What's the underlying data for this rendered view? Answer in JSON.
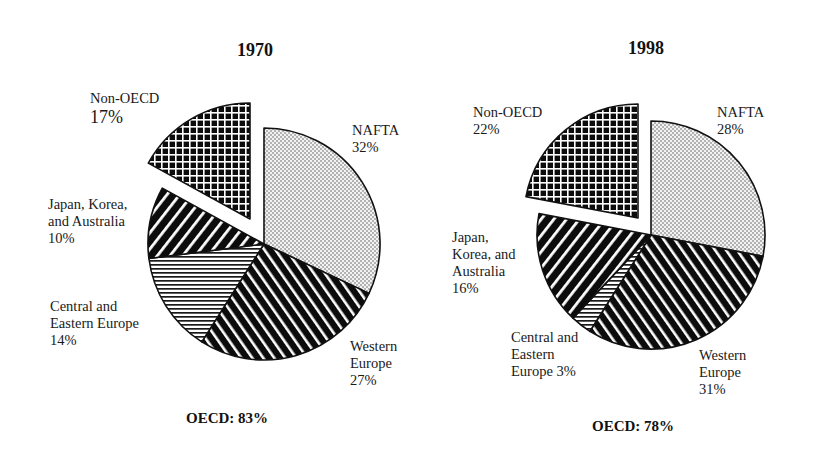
{
  "chart_data": [
    {
      "type": "pie",
      "title": "1970",
      "total_label": "OECD: 83%",
      "center": [
        264,
        244
      ],
      "radius": 116,
      "explode": {
        "slice": "Non-OECD",
        "dx": -14,
        "dy": -25
      },
      "slices": [
        {
          "label": "NAFTA",
          "value": 32,
          "pattern": "dots"
        },
        {
          "label": "Western Europe",
          "value": 27,
          "pattern": "diag-down"
        },
        {
          "label": "Central and Eastern Europe",
          "value": 14,
          "pattern": "horiz"
        },
        {
          "label": "Japan, Korea, and Australia",
          "value": 10,
          "pattern": "diag-up"
        },
        {
          "label": "Non-OECD",
          "value": 17,
          "pattern": "grid"
        }
      ]
    },
    {
      "type": "pie",
      "title": "1998",
      "total_label": "OECD: 78%",
      "center": [
        651,
        235
      ],
      "radius": 114,
      "explode": {
        "slice": "Non-OECD",
        "dx": -13,
        "dy": -17
      },
      "slices": [
        {
          "label": "NAFTA",
          "value": 28,
          "pattern": "dots"
        },
        {
          "label": "Western Europe",
          "value": 31,
          "pattern": "diag-down"
        },
        {
          "label": "Central and Eastern Europe",
          "value": 3,
          "pattern": "horiz"
        },
        {
          "label": "Japan, Korea, and Australia",
          "value": 16,
          "pattern": "diag-up"
        },
        {
          "label": "Non-OECD",
          "value": 22,
          "pattern": "grid"
        }
      ]
    }
  ],
  "labels": {
    "left": {
      "title": "1970",
      "non_oecd": [
        "Non-OECD",
        "17%"
      ],
      "nafta": [
        "NAFTA",
        "32%"
      ],
      "japan": [
        "Japan, Korea,",
        "and Australia",
        "10%"
      ],
      "central": [
        "Central and",
        "Eastern Europe",
        "14%"
      ],
      "western": [
        "Western",
        "Europe",
        "27%"
      ],
      "total": "OECD: 83%"
    },
    "right": {
      "title": "1998",
      "non_oecd": [
        "Non-OECD",
        "22%"
      ],
      "nafta": [
        "NAFTA",
        "28%"
      ],
      "japan": [
        "Japan,",
        "Korea, and",
        "Australia",
        "16%"
      ],
      "central": [
        "Central and",
        "Eastern",
        "Europe 3%"
      ],
      "western": [
        "Western",
        "Europe",
        "31%"
      ],
      "total": "OECD: 78%"
    }
  }
}
